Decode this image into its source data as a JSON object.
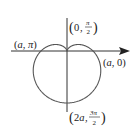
{
  "figure": {
    "type": "polar-curve",
    "origin_px": [
      67,
      51
    ],
    "a_px": 26,
    "colors": {
      "curve": "#555555",
      "axis": "#333333",
      "text": "#222222",
      "background": "#ffffff"
    },
    "points": [
      {
        "id": "a-pi",
        "r": "a",
        "theta": "π",
        "label": "(a, π)"
      },
      {
        "id": "zero-pi-over-2",
        "r": "0",
        "theta": "π/2",
        "label": "(0, π/2)"
      },
      {
        "id": "a-zero",
        "r": "a",
        "theta": "0",
        "label": "(a, 0)"
      },
      {
        "id": "2a-3pi-over-2",
        "r": "2a",
        "theta": "3π/2",
        "label": "(2a, 3π/2)"
      }
    ],
    "labels": {
      "a_pi": {
        "open": "(",
        "r": "a",
        "sep": ", ",
        "theta": "π",
        "close": ")"
      },
      "zero_half_pi": {
        "open": "(",
        "r": "0",
        "sep": ", ",
        "num": "π",
        "den": "2",
        "close": ")"
      },
      "a_zero": {
        "open": "(",
        "r": "a",
        "sep": ", ",
        "theta": "0",
        "close": ")"
      },
      "two_a_three_half_pi": {
        "open": "(",
        "r": "2a",
        "sep": ", ",
        "num": "3π",
        "den": "2",
        "close": ")"
      }
    }
  }
}
